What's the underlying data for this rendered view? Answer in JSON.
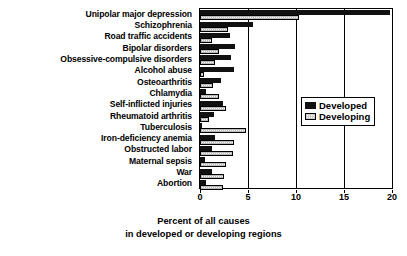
{
  "chart_data": {
    "type": "bar",
    "orientation": "horizontal",
    "title": "",
    "xlabel": "Percent of all causes in developed or developing regions",
    "xlabel_line1": "Percent of all causes",
    "xlabel_line2": "in developed or developing regions",
    "ylabel": "",
    "xlim": [
      0,
      20
    ],
    "xticks": [
      0,
      5,
      10,
      15,
      20
    ],
    "xtick_labels": [
      "0",
      "5",
      "10",
      "15",
      "20"
    ],
    "grid": true,
    "legend_position": "right-middle",
    "categories": [
      "Unipolar major depression",
      "Schizophrenia",
      "Road traffic accidents",
      "Bipolar disorders",
      "Obsessive-compulsive disorders",
      "Alcohol abuse",
      "Osteoarthritis",
      "Chlamydia",
      "Self-inflicted injuries",
      "Rheumatoid arthritis",
      "Tuberculosis",
      "Iron-deficiency anemia",
      "Obstructed labor",
      "Maternal sepsis",
      "War",
      "Abortion"
    ],
    "series": [
      {
        "name": "Developed",
        "color": "#111111",
        "values": [
          19.8,
          5.5,
          3.1,
          3.6,
          3.2,
          3.5,
          2.2,
          0.6,
          2.4,
          1.5,
          0.2,
          1.6,
          1.3,
          0.5,
          1.2,
          0.6
        ]
      },
      {
        "name": "Developing",
        "color": "#ffffff",
        "values": [
          10.3,
          2.9,
          1.3,
          2.0,
          1.6,
          0.4,
          1.4,
          2.0,
          2.7,
          0.9,
          4.8,
          3.5,
          3.4,
          2.7,
          2.5,
          2.4
        ]
      }
    ]
  },
  "legend": {
    "items": [
      {
        "label": "Developed",
        "swatch": "filled-black-square"
      },
      {
        "label": "Developing",
        "swatch": "open-white-square"
      }
    ]
  }
}
